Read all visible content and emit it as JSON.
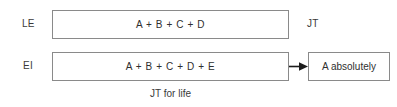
{
  "diagram": {
    "type": "block-flow-diagram",
    "background_color": "#ffffff",
    "border_color": "#8a8a8a",
    "text_color": "#2f2f2f",
    "rows": [
      {
        "id": "row1",
        "left_label": "LE",
        "box_text": "A + B + C + D",
        "right_label": "JT",
        "has_arrow": false
      },
      {
        "id": "row2",
        "left_label": "EI",
        "box_text": "A + B + C + D + E",
        "arrow_icon": "arrow-right-icon",
        "has_arrow": true,
        "result_box_text": "A absolutely"
      }
    ],
    "caption": "JT for life"
  }
}
